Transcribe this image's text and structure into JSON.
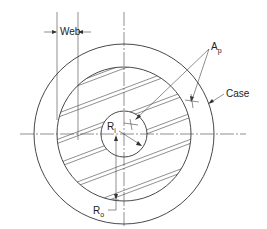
{
  "diagram": {
    "type": "cross-section",
    "labels": {
      "web": "Web",
      "ap_main": "A",
      "ap_sub": "p",
      "case": "Case",
      "ri_main": "R",
      "ri_sub": "i",
      "ro_main": "R",
      "ro_sub": "o"
    },
    "geometry": {
      "center": [
        124,
        134
      ],
      "case_radius": 90,
      "grain_outer_radius": 67,
      "bore_radius": 23
    },
    "colors": {
      "line": "#333333",
      "background": "#ffffff"
    }
  }
}
